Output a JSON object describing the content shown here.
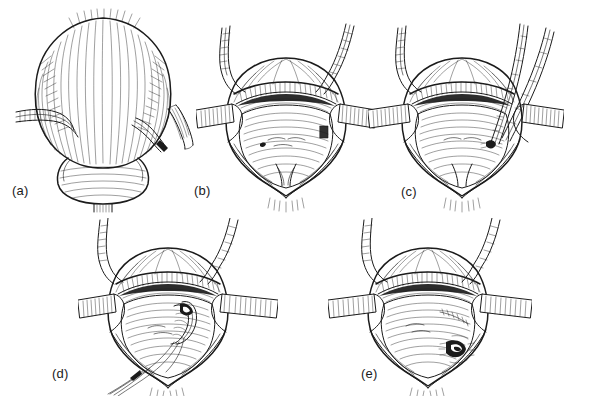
{
  "figure": {
    "kind": "surgical-line-illustration-plate",
    "panel_count": 5,
    "ink_color": "#1b1b1b",
    "background_color": "#ffffff",
    "panels": [
      {
        "id": "a",
        "label": "(a)",
        "caption_text": "(a)",
        "subject": "distended bladder viewed from front with two ureters entering laterally; right ureter divided and a short excised ureteral segment lying free to the right; bladder neck and proximal urethra below",
        "elements": [
          "bladder-dome",
          "longitudinal-muscle-striations",
          "left-ureter",
          "right-ureter-cut-end",
          "excised-ureteral-segment",
          "bladder-neck",
          "urethral-stump"
        ]
      },
      {
        "id": "b",
        "label": "(b)",
        "caption_text": "(b)",
        "subject": "bladder opened by anterior cystotomy and held open with two lateral retractor blades; interior trigone and posterior wall exposed; both ureters descending from above",
        "elements": [
          "open-cystotomy",
          "cut-bladder-edge-hatching",
          "left-retractor-blade",
          "right-retractor-blade",
          "trigone",
          "left-ureter",
          "right-ureter",
          "stay-sutures"
        ]
      },
      {
        "id": "c",
        "label": "(c)",
        "caption_text": "(c)",
        "subject": "a clamp/forceps passed through the bladder wall from outside into the lumen to create the submucosal tunnel for the ureter",
        "elements": [
          "open-cystotomy",
          "cut-bladder-edge-hatching",
          "left-retractor-blade",
          "right-retractor-blade",
          "tunnelling-forceps",
          "new-hiatus",
          "trigone",
          "left-ureter"
        ]
      },
      {
        "id": "d",
        "label": "(d)",
        "caption_text": "(d)",
        "subject": "ureter drawn into the bladder through the new hiatus and anchored with mucosal sutures; suture ends running out of the wound inferiorly",
        "elements": [
          "open-cystotomy",
          "cut-bladder-edge-hatching",
          "left-retractor-blade",
          "right-retractor-blade",
          "ureteral-stump-in-lumen",
          "anastomotic-sutures",
          "trailing-suture-tails",
          "trigone"
        ]
      },
      {
        "id": "e",
        "label": "(e)",
        "caption_text": "(e)",
        "subject": "completed reimplantation showing the new ureteric orifice flush with bladder mucosa and the closed submucosal tunnel suture line",
        "elements": [
          "open-cystotomy",
          "cut-bladder-edge-hatching",
          "left-retractor-blade",
          "right-retractor-blade",
          "new-ureteric-orifice",
          "tunnel-suture-line",
          "trigone"
        ]
      }
    ]
  }
}
